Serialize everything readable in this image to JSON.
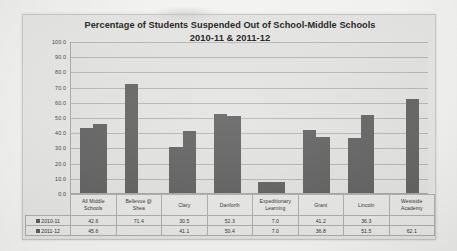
{
  "chart_data": {
    "type": "bar",
    "title": "Percentage of Students Suspended Out of School-Middle Schools",
    "subtitle": "2010-11 & 2011-12",
    "xlabel": "",
    "ylabel": "",
    "ylim": [
      0,
      100
    ],
    "grid": true,
    "legend_position": "data-table-left",
    "categories": [
      "All Middle Schools",
      "Bellevue @ Shea",
      "Clary",
      "Danforth",
      "Expeditionary Learning",
      "Grant",
      "Lincoln",
      "Westside Academy"
    ],
    "category_lines": [
      [
        "All Middle",
        "Schools"
      ],
      [
        "Bellevue @",
        "Shea"
      ],
      [
        "Clary",
        ""
      ],
      [
        "Danforth",
        ""
      ],
      [
        "Expeditionary",
        "Learning"
      ],
      [
        "Grant",
        ""
      ],
      [
        "Lincoln",
        ""
      ],
      [
        "Westside",
        "Academy"
      ]
    ],
    "series": [
      {
        "name": "2010-11",
        "color": "#5e5e5e",
        "values": [
          42.6,
          71.4,
          30.5,
          52.3,
          7.0,
          41.2,
          36.3,
          null
        ],
        "labels": [
          "42.6",
          "71.4",
          "30.5",
          "52.3",
          "7.0",
          "41.2",
          "36.3",
          ""
        ]
      },
      {
        "name": "2011-12",
        "color": "#5e5e5e",
        "values": [
          45.6,
          null,
          41.1,
          50.4,
          7.0,
          36.8,
          51.5,
          62.1
        ],
        "labels": [
          "45.6",
          "",
          "41.1",
          "50.4",
          "7.0",
          "36.8",
          "51.5",
          "62.1"
        ]
      }
    ],
    "yticks": [
      "100.0",
      "90.0",
      "80.0",
      "70.0",
      "60.0",
      "50.0",
      "40.0",
      "30.0",
      "20.0",
      "10.0",
      "0.0"
    ],
    "ytick_values": [
      100,
      90,
      80,
      70,
      60,
      50,
      40,
      30,
      20,
      10,
      0
    ]
  },
  "colors": {
    "bar": "#5e5e5e",
    "panel_background": "#e8e8e6",
    "plot_background": "#e5e5e3",
    "gridline": "#b6b6b3",
    "axis": "#a7a7a4",
    "text": "#2a2a2a"
  }
}
